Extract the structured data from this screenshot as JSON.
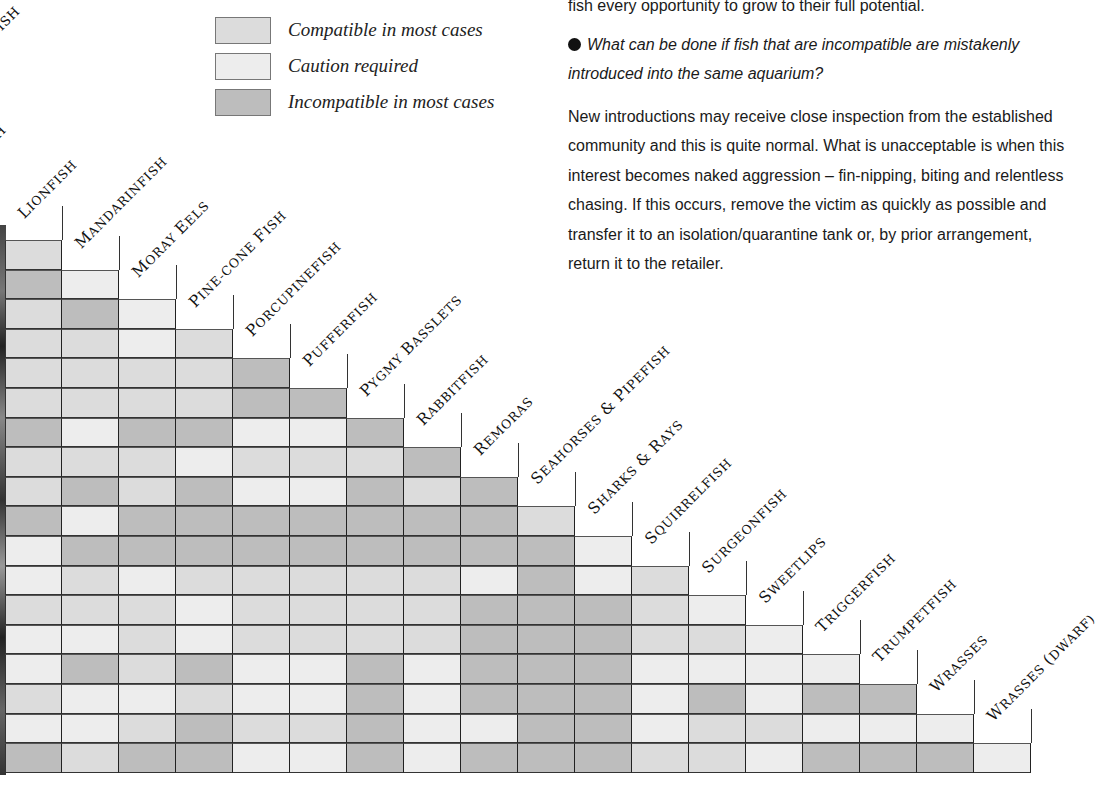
{
  "legend": {
    "items": [
      {
        "key": "C",
        "label": "Compatible in most cases",
        "color": "#dcdcdc"
      },
      {
        "key": "A",
        "label": "Caution required",
        "color": "#ededed"
      },
      {
        "key": "I",
        "label": "Incompatible in most cases",
        "color": "#bdbdbd"
      }
    ]
  },
  "partial_labels": [
    "AFISH",
    "SH"
  ],
  "text": {
    "line0": "fish every opportunity to grow to their full potential.",
    "question": "What can be done if fish that are incompatible are mistakenly introduced into the same aquarium?",
    "answer": "New introductions may receive close inspection from the established community and this is quite normal. What is unacceptable is when this interest becomes naked aggression – fin-nipping, biting and relentless chasing. If this occurs,  remove the victim as quickly as possible and transfer it to an isolation/quarantine tank or, by prior arrangement, return it to the retailer."
  },
  "chart_data": {
    "type": "heatmap",
    "legend_position": "top",
    "categories": [
      "Lionfish",
      "Mandarinfish",
      "Moray Eels",
      "Pine-Cone Fish",
      "Porcupinefish",
      "Pufferfish",
      "Pygmy Basslets",
      "Rabbitfish",
      "Remoras",
      "Seahorses & Pipefish",
      "Sharks & Rays",
      "Squirrelfish",
      "Surgeonfish",
      "Sweetlips",
      "Triggerfish",
      "Trumpetfish",
      "Wrasses",
      "Wrasses (Dwarf)"
    ],
    "value_key": {
      "C": "Compatible in most cases",
      "A": "Caution required",
      "I": "Incompatible in most cases"
    },
    "rows": [
      [
        "C"
      ],
      [
        "I",
        "A"
      ],
      [
        "C",
        "I",
        "A"
      ],
      [
        "C",
        "C",
        "A",
        "C"
      ],
      [
        "C",
        "C",
        "C",
        "C",
        "I"
      ],
      [
        "C",
        "C",
        "C",
        "C",
        "I",
        "I"
      ],
      [
        "I",
        "A",
        "I",
        "I",
        "A",
        "A",
        "I"
      ],
      [
        "C",
        "C",
        "C",
        "A",
        "C",
        "C",
        "C",
        "I"
      ],
      [
        "C",
        "I",
        "C",
        "I",
        "A",
        "A",
        "I",
        "C",
        "I"
      ],
      [
        "I",
        "A",
        "I",
        "I",
        "I",
        "I",
        "I",
        "I",
        "I",
        "C"
      ],
      [
        "A",
        "I",
        "I",
        "I",
        "I",
        "I",
        "I",
        "I",
        "I",
        "I",
        "A"
      ],
      [
        "A",
        "C",
        "A",
        "C",
        "C",
        "C",
        "C",
        "C",
        "A",
        "I",
        "A",
        "C"
      ],
      [
        "C",
        "C",
        "C",
        "A",
        "C",
        "C",
        "C",
        "C",
        "I",
        "I",
        "I",
        "C",
        "A"
      ],
      [
        "A",
        "A",
        "C",
        "A",
        "C",
        "C",
        "C",
        "C",
        "I",
        "I",
        "I",
        "C",
        "C",
        "A"
      ],
      [
        "A",
        "I",
        "C",
        "I",
        "A",
        "A",
        "I",
        "A",
        "I",
        "I",
        "I",
        "A",
        "A",
        "A",
        "A"
      ],
      [
        "C",
        "A",
        "A",
        "C",
        "A",
        "A",
        "I",
        "A",
        "I",
        "I",
        "I",
        "A",
        "I",
        "A",
        "I",
        "I"
      ],
      [
        "A",
        "A",
        "C",
        "I",
        "C",
        "C",
        "I",
        "A",
        "A",
        "I",
        "I",
        "A",
        "C",
        "C",
        "A",
        "A",
        "A"
      ],
      [
        "I",
        "C",
        "I",
        "I",
        "A",
        "A",
        "I",
        "A",
        "I",
        "I",
        "I",
        "C",
        "C",
        "A",
        "I",
        "I",
        "I",
        "A"
      ]
    ],
    "grid": true
  }
}
